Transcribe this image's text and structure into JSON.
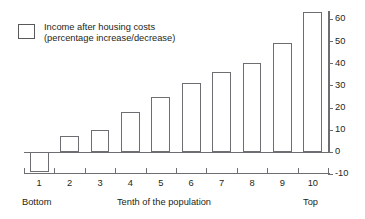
{
  "chart_data": {
    "type": "bar",
    "title": "",
    "subtitle": "",
    "xlabel": "Tenth of the population",
    "ylabel": "",
    "categories": [
      "1",
      "2",
      "3",
      "4",
      "5",
      "6",
      "7",
      "8",
      "9",
      "10"
    ],
    "values": [
      -9,
      7,
      10,
      18,
      25,
      31,
      36,
      40,
      49,
      63
    ],
    "series": [
      {
        "name": "Income after housing costs (percentage increase/decrease)",
        "values": [
          -9,
          7,
          10,
          18,
          25,
          31,
          36,
          40,
          49,
          63
        ]
      }
    ],
    "ylim": [
      -10,
      65
    ],
    "yticks": [
      -10,
      0,
      10,
      20,
      30,
      40,
      50,
      60
    ],
    "ytick_labels": [
      "-10",
      "0",
      "10",
      "20",
      "30",
      "40",
      "50",
      "60"
    ],
    "y_axis_position": "right",
    "grid": false,
    "legend_position": "top-left",
    "bar_fill": "#ffffff",
    "bar_stroke": "#6d6e71",
    "axis_color": "#6d6e71",
    "text_color": "#231f20"
  },
  "legend": {
    "line1": "Income after housing costs",
    "line2": "(percentage increase/decrease)"
  },
  "axis_captions": {
    "left": "Bottom",
    "center": "Tenth of the population",
    "right": "Top"
  }
}
